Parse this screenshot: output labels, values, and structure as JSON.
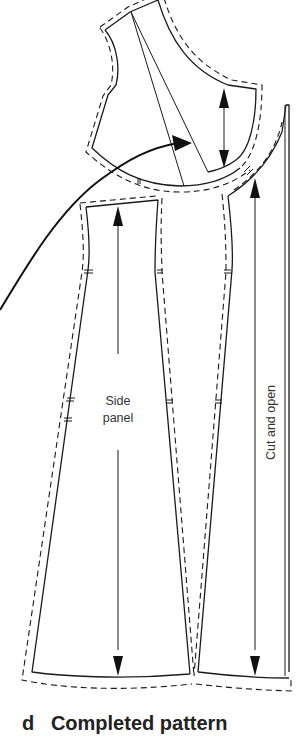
{
  "figure": {
    "caption_letter": "d",
    "caption_title": "Completed pattern",
    "labels": {
      "side_panel_line1": "Side",
      "side_panel_line2": "panel",
      "cut_and_open": "Cut and open"
    },
    "pieces": [
      {
        "name": "upper-bodice-piece",
        "description": "bodice top with shoulder and armhole curve, dart lines"
      },
      {
        "name": "side-panel-piece",
        "description": "left flared skirt panel"
      },
      {
        "name": "center-gore-piece",
        "description": "narrow tapered middle panel"
      },
      {
        "name": "front-panel-piece",
        "description": "right panel marked cut and open"
      }
    ],
    "annotations": [
      {
        "type": "grainline-arrow",
        "piece": "side-panel",
        "direction": "double"
      },
      {
        "type": "grainline-arrow",
        "piece": "front-panel",
        "direction": "double"
      },
      {
        "type": "measure-arrow",
        "piece": "upper-bodice",
        "direction": "double-vertical"
      },
      {
        "type": "curved-transfer-arrow",
        "from": "lower-left",
        "to": "bodice-dart"
      },
      {
        "type": "cut-line",
        "piece": "front-panel",
        "label": "Cut and open"
      }
    ],
    "colors": {
      "line": "#1a1a1a",
      "background": "#ffffff",
      "text": "#333333"
    }
  }
}
